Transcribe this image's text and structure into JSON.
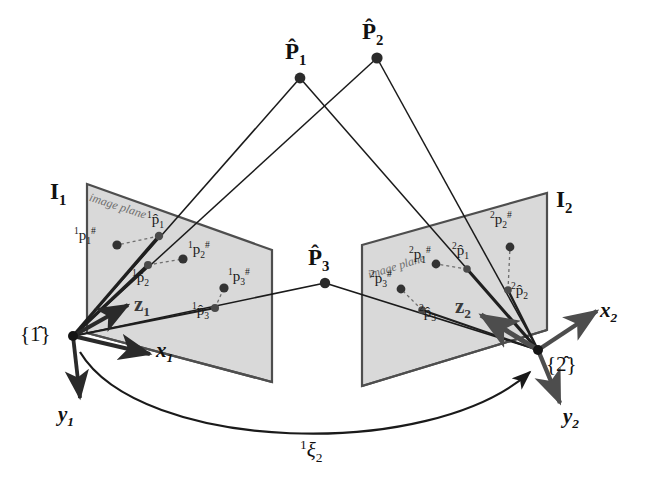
{
  "figure": {
    "background_color": "#ffffff",
    "plane_fill": "#d7d7d7",
    "plane_stroke": "#4a4a4a",
    "ray_color": "#1a1a1a",
    "axis_color": "#2a2a2a",
    "dash_color": "#7a7a7a"
  },
  "world_points": [
    {
      "name": "P1",
      "label_main": "P",
      "label_sub": "1",
      "hat": true,
      "x": 300,
      "y": 78
    },
    {
      "name": "P2",
      "label_main": "P",
      "label_sub": "2",
      "hat": true,
      "x": 377,
      "y": 58
    },
    {
      "name": "P3",
      "label_main": "P",
      "label_sub": "3",
      "hat": true,
      "x": 325,
      "y": 283
    }
  ],
  "frames": [
    {
      "name": "frame-1",
      "label": "{1̂}",
      "origin_x": 73,
      "origin_y": 336,
      "axes": [
        {
          "name": "z1",
          "label": "z",
          "sub": "1",
          "label_x": 138,
          "label_y": 300
        },
        {
          "name": "x1",
          "label": "x",
          "sub": "1",
          "label_x": 160,
          "label_y": 348
        },
        {
          "name": "y1",
          "label": "y",
          "sub": "1",
          "label_x": 64,
          "label_y": 418
        }
      ]
    },
    {
      "name": "frame-2",
      "label": "{2̂}",
      "origin_x": 538,
      "origin_y": 350,
      "axes": [
        {
          "name": "z2",
          "label": "z",
          "sub": "2",
          "label_x": 461,
          "label_y": 302
        },
        {
          "name": "x2",
          "label": "x",
          "sub": "2",
          "label_x": 605,
          "label_y": 316
        },
        {
          "name": "y2",
          "label": "y",
          "sub": "2",
          "label_x": 570,
          "label_y": 420
        }
      ]
    }
  ],
  "image_planes": [
    {
      "name": "image-plane-1",
      "plane_label": "I",
      "plane_label_sub": "1",
      "plane_label_x": 52,
      "plane_label_y": 182,
      "annotation": "image plane",
      "annotation_x": 94,
      "annotation_y": 192,
      "annotation_rotation": 18,
      "corners": "87,184 272,250 272,382 87,333"
    },
    {
      "name": "image-plane-2",
      "plane_label": "I",
      "plane_label_sub": "2",
      "plane_label_x": 556,
      "plane_label_y": 190,
      "annotation": "image plane",
      "annotation_x": 368,
      "annotation_y": 262,
      "annotation_rotation": -17,
      "corners": "362,245 547,193 547,330 362,386"
    }
  ],
  "image_points": [
    {
      "name": "p1-hash-cam1",
      "kind": "measured",
      "presup": "1",
      "base": "p",
      "sub": "1",
      "post": "#",
      "hat": false,
      "dot_x": 117,
      "dot_y": 245,
      "label_x": 76,
      "label_y": 228
    },
    {
      "name": "p1-hat-cam1",
      "kind": "estimated",
      "presup": "1",
      "base": "p",
      "sub": "1",
      "post": "",
      "hat": true,
      "dot_x": 159,
      "dot_y": 236,
      "label_x": 152,
      "label_y": 214
    },
    {
      "name": "p2-hash-cam1",
      "kind": "measured",
      "presup": "1",
      "base": "p",
      "sub": "2",
      "post": "#",
      "hat": false,
      "dot_x": 183,
      "dot_y": 259,
      "label_x": 189,
      "label_y": 243
    },
    {
      "name": "p2-hat-cam1",
      "kind": "estimated",
      "presup": "1",
      "base": "p",
      "sub": "2",
      "post": "",
      "hat": true,
      "dot_x": 148,
      "dot_y": 265,
      "label_x": 137,
      "label_y": 272
    },
    {
      "name": "p3-hash-cam1",
      "kind": "measured",
      "presup": "1",
      "base": "p",
      "sub": "3",
      "post": "#",
      "hat": false,
      "dot_x": 224,
      "dot_y": 288,
      "label_x": 229,
      "label_y": 270
    },
    {
      "name": "p3-hat-cam1",
      "kind": "estimated",
      "presup": "1",
      "base": "p",
      "sub": "3",
      "post": "",
      "hat": true,
      "dot_x": 215,
      "dot_y": 308,
      "label_x": 197,
      "label_y": 304
    },
    {
      "name": "p1-hash-cam2",
      "kind": "measured",
      "presup": "2",
      "base": "p",
      "sub": "1",
      "post": "#",
      "hat": false,
      "dot_x": 436,
      "dot_y": 264,
      "label_x": 414,
      "label_y": 248
    },
    {
      "name": "p1-hat-cam2",
      "kind": "estimated",
      "presup": "2",
      "base": "p",
      "sub": "1",
      "post": "",
      "hat": true,
      "dot_x": 467,
      "dot_y": 269,
      "label_x": 458,
      "label_y": 245
    },
    {
      "name": "p2-hash-cam2",
      "kind": "measured",
      "presup": "2",
      "base": "p",
      "sub": "2",
      "post": "#",
      "hat": false,
      "dot_x": 510,
      "dot_y": 247,
      "label_x": 492,
      "label_y": 214
    },
    {
      "name": "p2-hat-cam2",
      "kind": "estimated",
      "presup": "2",
      "base": "p",
      "sub": "2",
      "post": "",
      "hat": true,
      "dot_x": 508,
      "dot_y": 290,
      "label_x": 512,
      "label_y": 284
    },
    {
      "name": "p3-hash-cam2",
      "kind": "measured",
      "presup": "2",
      "base": "p",
      "sub": "3",
      "post": "#",
      "hat": false,
      "dot_x": 401,
      "dot_y": 289,
      "label_x": 374,
      "label_y": 272
    },
    {
      "name": "p3-hat-cam2",
      "kind": "estimated",
      "presup": "2",
      "base": "p",
      "sub": "3",
      "post": "",
      "hat": true,
      "dot_x": 422,
      "dot_y": 310,
      "label_x": 421,
      "label_y": 307
    }
  ],
  "transform": {
    "name": "relative-pose",
    "presup": "1",
    "symbol": "ξ",
    "sub": "2",
    "label_x": 308,
    "label_y": 443
  }
}
